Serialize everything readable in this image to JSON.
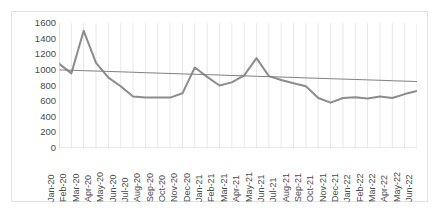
{
  "chart_data": {
    "type": "line",
    "title": "",
    "subtitle": "",
    "xlabel": "",
    "ylabel": "",
    "ylim": [
      0,
      1600
    ],
    "ytick_step": 200,
    "yticks": [
      1600,
      1400,
      1200,
      1000,
      800,
      600,
      400,
      200,
      0
    ],
    "grid": "vertical",
    "legend": "none",
    "categories": [
      "Jan-20",
      "Feb-20",
      "Mar-20",
      "Apr-20",
      "May-20",
      "Jun-20",
      "Jul-20",
      "Aug-20",
      "Sep-20",
      "Oct-20",
      "Nov-20",
      "Dec-20",
      "Jan-21",
      "Feb-21",
      "Mar-21",
      "Apr-21",
      "May-21",
      "Jun-21",
      "Jul-21",
      "Aug-21",
      "Sep-21",
      "Oct-21",
      "Nov-21",
      "Dec-21",
      "Jan-22",
      "Feb-22",
      "Mar-22",
      "Apr-22",
      "May-22",
      "Jun-22"
    ],
    "series": [
      {
        "name": "Series 1",
        "kind": "line",
        "color": "#8c8c8c",
        "values": [
          1080,
          955,
          1500,
          1090,
          900,
          790,
          660,
          645,
          645,
          645,
          700,
          1030,
          910,
          800,
          840,
          930,
          1150,
          920,
          870,
          830,
          790,
          640,
          580,
          640,
          650,
          635,
          660,
          640,
          690,
          730
        ]
      },
      {
        "name": "Linear trendline",
        "kind": "trendline",
        "color": "#808080",
        "values": [
          1000,
          995,
          990,
          985,
          980,
          975,
          970,
          964,
          959,
          954,
          949,
          944,
          939,
          934,
          928,
          923,
          918,
          913,
          908,
          903,
          897,
          892,
          887,
          882,
          877,
          872,
          867,
          861,
          856,
          851
        ]
      }
    ]
  },
  "colors": {
    "series_line": "#8c8c8c",
    "trendline": "#808080",
    "gridline": "#e8e8e8",
    "axis": "#d0d0d0",
    "tick_text": "#4a4a4a",
    "border": "#e2e2e2",
    "background": "#ffffff"
  }
}
